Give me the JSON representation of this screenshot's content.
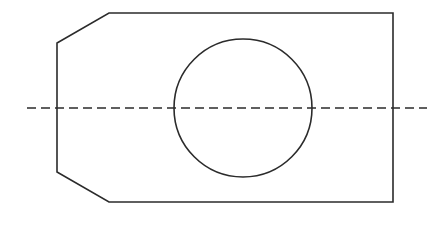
{
  "drawing": {
    "title": "Chamfered Plate with Central Through Hole",
    "view_type": "orthographic-front-view",
    "canvas": {
      "width": 447,
      "height": 229,
      "background_color": "#ffffff"
    },
    "line_color": "#2b2b2b",
    "line_width": 1.6,
    "outline": {
      "name": "plate-outline",
      "shape": "chamfered-rectangle",
      "points": "109,13 393,13 393,202 109,202 57,172 57,43",
      "closed": true,
      "vertices": [
        {
          "label": "top-left-chamfer-end",
          "x": 109,
          "y": 13
        },
        {
          "label": "top-right-corner",
          "x": 393,
          "y": 13
        },
        {
          "label": "bottom-right-corner",
          "x": 393,
          "y": 202
        },
        {
          "label": "bottom-left-chamfer-end",
          "x": 109,
          "y": 202
        },
        {
          "label": "lower-left-chamfer-vertex",
          "x": 57,
          "y": 172
        },
        {
          "label": "upper-left-chamfer-vertex",
          "x": 57,
          "y": 43
        }
      ],
      "width_px": 336,
      "height_px": 189
    },
    "hole": {
      "name": "through-hole",
      "center_x": 243,
      "center_y": 108,
      "radius": 69,
      "diameter": 138
    },
    "center_line": {
      "name": "horizontal-center-line",
      "x1": 27,
      "x2": 427,
      "y": 108,
      "style": "dashed",
      "dash_length": 9,
      "gap_length": 5,
      "color": "#2b2b2b"
    }
  }
}
